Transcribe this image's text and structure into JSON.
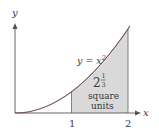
{
  "figure": {
    "type": "area-under-curve",
    "function": "y = x^2",
    "axes": {
      "x_label": "x",
      "y_label": "y",
      "x_ticks": [
        "1",
        "2"
      ]
    },
    "curve_label": {
      "lhs": "y = x",
      "exponent": "2"
    },
    "shaded_region": {
      "from_x": 1,
      "to_x": 2,
      "area_whole": "2",
      "area_numerator": "1",
      "area_denominator": "3",
      "area_text_line1": "square",
      "area_text_line2": "units",
      "fill_color": "#d9d9d9"
    },
    "colors": {
      "axis": "#555555",
      "curve": "#6b4a4a",
      "text": "#3a3a3a"
    }
  }
}
